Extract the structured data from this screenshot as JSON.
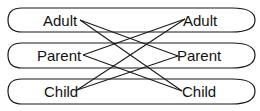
{
  "diagram": {
    "rows": [
      {
        "label_left": "Adult",
        "label_right": "Adult"
      },
      {
        "label_left": "Parent",
        "label_right": "Parent"
      },
      {
        "label_left": "Child",
        "label_right": "Child"
      }
    ],
    "edges": [
      {
        "from": "Adult",
        "to": "Parent"
      },
      {
        "from": "Adult",
        "to": "Child"
      },
      {
        "from": "Parent",
        "to": "Adult"
      },
      {
        "from": "Parent",
        "to": "Child"
      },
      {
        "from": "Child",
        "to": "Adult"
      },
      {
        "from": "Child",
        "to": "Parent"
      }
    ],
    "colors": {
      "stroke": "#1a1a1a",
      "background": "#ffffff"
    }
  }
}
